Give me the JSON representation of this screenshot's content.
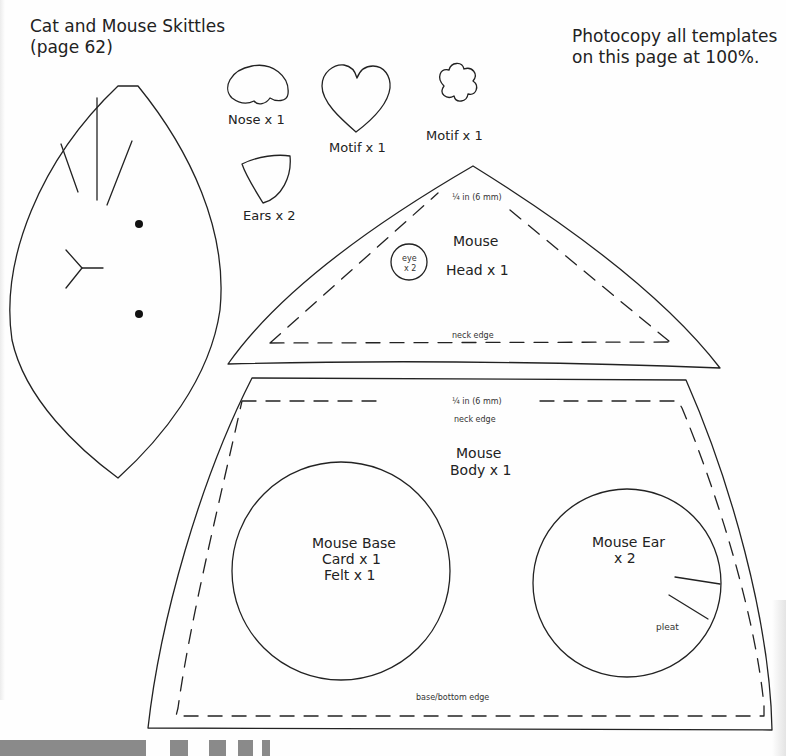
{
  "header": {
    "title_line1": "Cat and Mouse Skittles",
    "title_line2": "(page 62)",
    "note_line1": "Photocopy all templates",
    "note_line2": "on this page at 100%."
  },
  "pieces": {
    "nose": {
      "label": "Nose x 1"
    },
    "heart_motif": {
      "label": "Motif x 1"
    },
    "flower_motif": {
      "label": "Motif x 1"
    },
    "ears": {
      "label": "Ears x 2"
    },
    "cat_face": {
      "label": ""
    },
    "mouse_head": {
      "seam_allowance": "¼ in (6 mm)",
      "title": "Mouse",
      "count": "Head x 1",
      "eye_label": "eye",
      "eye_count": "x 2",
      "edge_label": "neck edge"
    },
    "mouse_body": {
      "seam_allowance": "¼ in (6 mm)",
      "top_edge_label": "neck edge",
      "title": "Mouse",
      "count": "Body x 1",
      "bottom_edge_label": "base/bottom edge"
    },
    "mouse_base": {
      "title": "Mouse Base",
      "line2": "Card x 1",
      "line3": "Felt x 1"
    },
    "mouse_ear": {
      "title": "Mouse Ear",
      "count": "x 2",
      "pleat_label": "pleat"
    }
  },
  "colors": {
    "ink": "#222222",
    "paper": "#fefefe",
    "footer_bar": "#8a8a8a"
  }
}
